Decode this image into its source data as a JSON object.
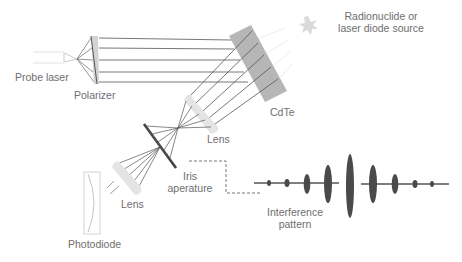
{
  "labels": {
    "probe_laser": "Probe laser",
    "polarizer": "Polarizer",
    "source_line1": "Radionuclide or",
    "source_line2": "laser diode source",
    "cdte": "CdTe",
    "lens_upper": "Lens",
    "iris_line1": "Iris",
    "iris_line2": "aperature",
    "lens_lower": "Lens",
    "photodiode": "Photodiode",
    "interference_line1": "Interference",
    "interference_line2": "pattern"
  },
  "colors": {
    "beam": "#555555",
    "component_fill": "#c8c8c8",
    "cdte_fill": "#b4b4b4",
    "lens_fill": "#e6e6e6",
    "iris": "#444444",
    "fringe": "#4a4a4a",
    "label": "#6e6e6e",
    "source_star": "#d8d8d8"
  },
  "interference_fringes": [
    {
      "x": 29,
      "ry": 3
    },
    {
      "x": 47,
      "ry": 4
    },
    {
      "x": 67,
      "ry": 9
    },
    {
      "x": 88,
      "ry": 19
    },
    {
      "x": 110,
      "ry": 31
    },
    {
      "x": 133,
      "ry": 19
    },
    {
      "x": 155,
      "ry": 9
    },
    {
      "x": 175,
      "ry": 4
    },
    {
      "x": 192,
      "ry": 3
    }
  ]
}
